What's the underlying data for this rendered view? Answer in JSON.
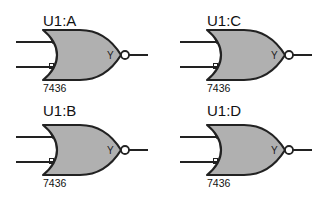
{
  "diagram": {
    "type": "logic-schematic",
    "colors": {
      "gate_fill": "#b0b0b0",
      "stroke": "#222222",
      "background": "#ffffff"
    },
    "gates": [
      {
        "ref": "U1:A",
        "part": "7436",
        "output_pin": "Y",
        "symbol": "nor-gate",
        "x": 0,
        "y": 0
      },
      {
        "ref": "U1:C",
        "part": "7436",
        "output_pin": "Y",
        "symbol": "nor-gate",
        "x": 164,
        "y": 0
      },
      {
        "ref": "U1:B",
        "part": "7436",
        "output_pin": "Y",
        "symbol": "nor-gate",
        "x": 0,
        "y": 95
      },
      {
        "ref": "U1:D",
        "part": "7436",
        "output_pin": "Y",
        "symbol": "nor-gate",
        "x": 164,
        "y": 95
      }
    ]
  }
}
